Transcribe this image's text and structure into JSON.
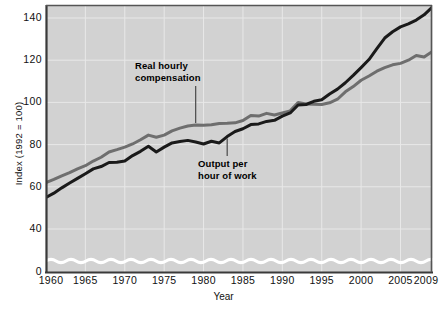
{
  "chart_data": {
    "type": "line",
    "title": "",
    "xlabel": "Year",
    "ylabel": "Index (1992 = 100)",
    "xlim": [
      1960,
      2009
    ],
    "ylim": [
      0,
      148
    ],
    "y_axis_break": true,
    "y_axis_break_note": "axis broken between 0 and ~30 (white wavy band)",
    "grid": true,
    "legend_position": "inline-annotations",
    "x_ticks": [
      "1960",
      "1965",
      "1970",
      "1975",
      "1980",
      "1985",
      "1990",
      "1995",
      "2000",
      "2005",
      "2009"
    ],
    "x_tick_values": [
      1960,
      1965,
      1970,
      1975,
      1980,
      1985,
      1990,
      1995,
      2000,
      2005,
      2009
    ],
    "y_ticks": [
      "0",
      "40",
      "60",
      "80",
      "100",
      "120",
      "140"
    ],
    "y_tick_values": [
      0,
      40,
      60,
      80,
      100,
      120,
      140
    ],
    "x": [
      1960,
      1961,
      1962,
      1963,
      1964,
      1965,
      1966,
      1967,
      1968,
      1969,
      1970,
      1971,
      1972,
      1973,
      1974,
      1975,
      1976,
      1977,
      1978,
      1979,
      1980,
      1981,
      1982,
      1983,
      1984,
      1985,
      1986,
      1987,
      1988,
      1989,
      1990,
      1991,
      1992,
      1993,
      1994,
      1995,
      1996,
      1997,
      1998,
      1999,
      2000,
      2001,
      2002,
      2003,
      2004,
      2005,
      2006,
      2007,
      2008,
      2009
    ],
    "series": [
      {
        "name": "Real hourly compensation",
        "color": "#6e6e6e",
        "values": [
          62.0,
          63.5,
          65.2,
          66.7,
          68.5,
          70.0,
          72.2,
          74.0,
          76.5,
          77.6,
          78.8,
          80.3,
          82.3,
          84.5,
          83.5,
          84.5,
          86.5,
          87.8,
          88.8,
          89.3,
          89.2,
          89.4,
          90.0,
          90.1,
          90.3,
          91.4,
          93.8,
          93.5,
          94.8,
          94.0,
          95.0,
          96.0,
          100.0,
          99.2,
          99.1,
          99.0,
          99.8,
          101.5,
          105.0,
          107.5,
          110.5,
          112.5,
          114.8,
          116.5,
          117.8,
          118.5,
          120.0,
          122.2,
          121.5,
          124.0
        ]
      },
      {
        "name": "Output per hour of work",
        "color": "#1a1a1a",
        "values": [
          55.0,
          57.0,
          59.5,
          61.8,
          64.0,
          66.2,
          68.5,
          69.6,
          71.5,
          71.6,
          72.2,
          74.8,
          76.8,
          79.2,
          76.5,
          78.8,
          80.8,
          81.5,
          82.0,
          81.2,
          80.3,
          81.6,
          80.8,
          83.8,
          86.2,
          87.5,
          89.5,
          89.8,
          91.0,
          91.5,
          93.5,
          95.0,
          98.8,
          99.0,
          100.5,
          101.3,
          104.0,
          106.3,
          109.3,
          112.8,
          116.5,
          120.3,
          125.5,
          130.5,
          133.5,
          135.8,
          137.2,
          139.0,
          141.5,
          145.0
        ]
      }
    ],
    "annotations": [
      {
        "id": "real-hourly-compensation",
        "text": "Real hourly\ncompensation",
        "target_series": "Real hourly compensation",
        "target_year": 1979
      },
      {
        "id": "output-per-hour-of-work",
        "text": "Output per\nhour of work",
        "target_series": "Output per hour of work",
        "target_year": 1983
      }
    ]
  },
  "axes": {
    "y_title": "Index (1992 = 100)",
    "x_title": "Year"
  },
  "colors": {
    "plot_background": "#d2d2d2",
    "gridline": "#e8e8e8",
    "axis": "#3a3a3a",
    "compensation_line": "#6e6e6e",
    "output_line": "#1a1a1a",
    "break_band": "#ffffff",
    "text": "#111111"
  }
}
